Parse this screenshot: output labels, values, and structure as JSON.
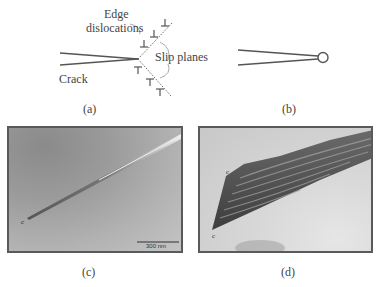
{
  "figure": {
    "panels": [
      {
        "id": "a",
        "caption": "(a)",
        "labels": {
          "edge_dislocations_line1": "Edge",
          "edge_dislocations_line2": "dislocations",
          "slip_planes": "Slip planes",
          "crack": "Crack"
        },
        "description": "Schematic of a crack tip emitting edge dislocations along two slip planes"
      },
      {
        "id": "b",
        "caption": "(b)",
        "description": "Schematic of a blunted crack tip (rounded tip)"
      },
      {
        "id": "c",
        "caption": "(c)",
        "tip_marker": "c",
        "scale_bar": "300 nm",
        "description": "Micrograph of a sharp crack"
      },
      {
        "id": "d",
        "caption": "(d)",
        "tip_markers": [
          "c",
          "c"
        ],
        "description": "Micrograph of a crack with dislocation bands"
      }
    ],
    "colors": {
      "line": "#555555",
      "text": "#444444",
      "frame": "#5a5a5a"
    }
  }
}
